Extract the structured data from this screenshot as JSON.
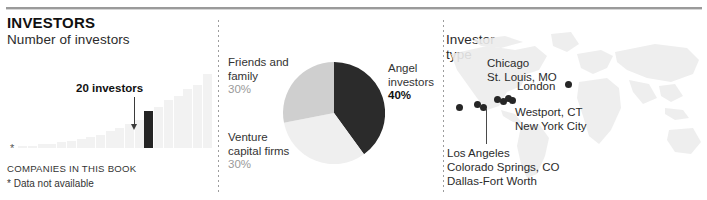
{
  "header": {
    "kicker": "INVESTORS"
  },
  "panels": {
    "bars": {
      "title": "Number of investors",
      "callout": "20 investors",
      "asterisk": "*",
      "footnote_caps": "COMPANIES IN THIS BOOK",
      "footnote_note": "* Data not available"
    },
    "pie": {
      "title": "Investor type",
      "labels": {
        "friends_line1": "Friends and",
        "friends_line2": "family",
        "friends_pct": "30%",
        "angel_line1": "Angel",
        "angel_line2": "investors",
        "angel_pct": "40%",
        "venture_line1": "Venture",
        "venture_line2": "capital firms",
        "venture_pct": "30%"
      }
    },
    "map": {
      "title": "Primary locations",
      "labels": {
        "chicago": "Chicago",
        "st_louis": "St. Louis, MO",
        "london": "London",
        "westport": "Westport, CT",
        "new_york": "New York City",
        "los_angeles": "Los Angeles",
        "colorado_springs": "Colorado Springs, CO",
        "dallas": "Dallas-Fort Worth"
      }
    }
  },
  "chart_data": [
    {
      "type": "bar",
      "title": "Number of investors",
      "xlabel": "COMPANIES IN THIS BOOK",
      "ylabel": "",
      "annotation": "20 investors",
      "note": "* Data not available",
      "grid": false,
      "highlight_index": 13,
      "values": [
        1,
        1,
        2,
        2,
        3,
        4,
        5,
        6,
        7,
        9,
        11,
        13,
        15,
        20,
        22,
        26,
        28,
        32,
        34,
        40
      ],
      "ylim": [
        0,
        42
      ]
    },
    {
      "type": "pie",
      "title": "Investor type",
      "labels": [
        "Angel investors",
        "Venture capital firms",
        "Friends and family"
      ],
      "values": [
        40,
        30,
        30
      ],
      "colors": [
        "#2b2b2b",
        "#eeeeee",
        "#cccccc"
      ],
      "legend": "outside"
    },
    {
      "type": "scatter",
      "title": "Primary locations",
      "xlabel": "",
      "ylabel": "",
      "points": [
        {
          "label": "Los Angeles",
          "x": 13,
          "y": 62
        },
        {
          "label": "Colorado Springs, CO",
          "x": 32,
          "y": 60
        },
        {
          "label": "Dallas-Fort Worth",
          "x": 38,
          "y": 63
        },
        {
          "label": "Chicago",
          "x": 52,
          "y": 55
        },
        {
          "label": "St. Louis, MO",
          "x": 57,
          "y": 57
        },
        {
          "label": "New York City",
          "x": 62,
          "y": 54
        },
        {
          "label": "Westport, CT",
          "x": 65,
          "y": 56
        },
        {
          "label": "London",
          "x": 122,
          "y": 50
        }
      ]
    }
  ]
}
